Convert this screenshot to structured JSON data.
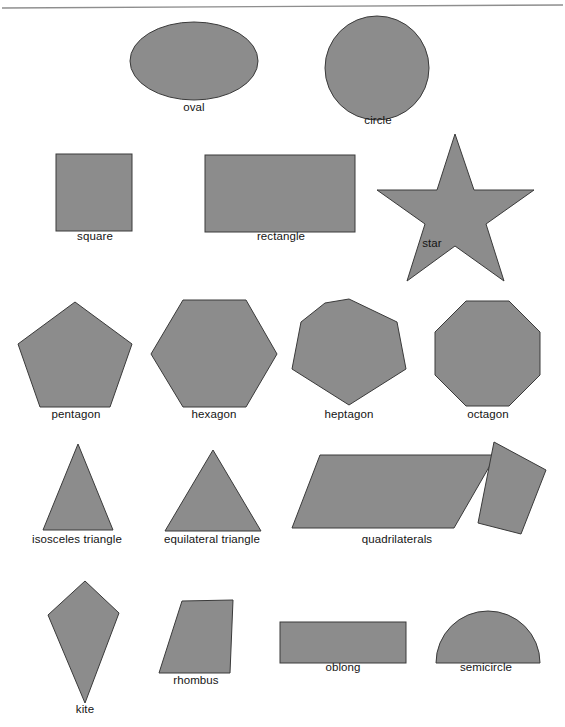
{
  "page": {
    "background_color": "#ffffff",
    "width": 565,
    "height": 727
  },
  "style": {
    "shape_fill": "#8c8c8c",
    "shape_stroke": "#3a3a3a",
    "label_color": "#141414",
    "rule_color": "#8e8e8e"
  },
  "divider": {
    "name": "top-rule",
    "x1": 2,
    "y1": 8,
    "x2": 563,
    "y2": 5
  },
  "rows": [
    {
      "row_name": "curved-and-round-shapes",
      "shapes": [
        {
          "key": "oval",
          "label": "oval",
          "type": "ellipse",
          "label_x": 194,
          "label_y": 107
        },
        {
          "key": "circle",
          "label": "circle",
          "type": "circle",
          "label_x": 378,
          "label_y": 120
        }
      ]
    },
    {
      "row_name": "quadrilaterals-and-star",
      "shapes": [
        {
          "key": "square",
          "label": "square",
          "type": "square",
          "label_x": 95,
          "label_y": 236
        },
        {
          "key": "rectangle",
          "label": "rectangle",
          "type": "rect",
          "label_x": 281,
          "label_y": 236
        },
        {
          "key": "star",
          "label": "star",
          "type": "star5",
          "label_x": 432,
          "label_y": 243
        }
      ]
    },
    {
      "row_name": "regular-polygons",
      "shapes": [
        {
          "key": "pentagon",
          "label": "pentagon",
          "type": "polygon5",
          "label_x": 76,
          "label_y": 414
        },
        {
          "key": "hexagon",
          "label": "hexagon",
          "type": "polygon6",
          "label_x": 214,
          "label_y": 414
        },
        {
          "key": "heptagon",
          "label": "heptagon",
          "type": "polygon7",
          "label_x": 349,
          "label_y": 414
        },
        {
          "key": "octagon",
          "label": "octagon",
          "type": "polygon8",
          "label_x": 488,
          "label_y": 414
        }
      ]
    },
    {
      "row_name": "triangles-and-quadrilaterals",
      "shapes": [
        {
          "key": "isosceles-triangle",
          "label": "isosceles triangle",
          "type": "triangle-isosceles",
          "label_x": 77,
          "label_y": 539
        },
        {
          "key": "equilateral-triangle",
          "label": "equilateral triangle",
          "type": "triangle-equilateral",
          "label_x": 212,
          "label_y": 539
        },
        {
          "key": "quadrilaterals",
          "label": "quadrilaterals",
          "type": "quad-group",
          "label_x": 397,
          "label_y": 539
        }
      ]
    },
    {
      "row_name": "kite-rhombus-oblong-semicircle",
      "shapes": [
        {
          "key": "kite",
          "label": "kite",
          "type": "kite",
          "label_x": 85,
          "label_y": 709
        },
        {
          "key": "rhombus",
          "label": "rhombus",
          "type": "rhombus",
          "label_x": 196,
          "label_y": 680
        },
        {
          "key": "oblong",
          "label": "oblong",
          "type": "oblong",
          "label_x": 343,
          "label_y": 667
        },
        {
          "key": "semicircle",
          "label": "semicircle",
          "type": "semicircle",
          "label_x": 486,
          "label_y": 667
        }
      ]
    }
  ],
  "geometry": {
    "oval": {
      "cx": 194,
      "cy": 61,
      "rx": 64,
      "ry": 39
    },
    "circle": {
      "cx": 377,
      "cy": 68,
      "r": 52
    },
    "square": {
      "x": 56,
      "y": 154,
      "w": 76,
      "h": 77
    },
    "rectangle": {
      "x": 205,
      "y": 155,
      "w": 150,
      "h": 77
    },
    "star": {
      "points": "455,134 474,190 534,190 486,224 504,281 455,246 407,281 425,224 377,190 437,190"
    },
    "pentagon": {
      "points": "75,302 132,344 110,407 40,407 18,344"
    },
    "hexagon": {
      "points": "183,300 246,300 277,354 246,407 183,407 151,354"
    },
    "heptagon": {
      "points": "349,299 392,320 402,366 349,402 297,366 307,320"
    },
    "heptagon7": {
      "points": "349,299 397,322 406,369 349,405 292,369 301,322 325,303"
    },
    "octagon": {
      "points": "466,301 509,301 540,332 540,375 509,406 466,406 435,375 435,332"
    },
    "tri_isosceles": {
      "points": "78,444 113,530 43,530"
    },
    "tri_equilateral": {
      "points": "213,450 261,531 165,531"
    },
    "quad_parallelogram": {
      "points": "320,455 496,455 454,528 292,528"
    },
    "quad_irregular": {
      "points": "494,442 546,470 521,534 478,523"
    },
    "kite": {
      "points": "85,581 119,613 85,703 48,615"
    },
    "rhombus": {
      "points": "182,601 233,600 230,673 159,673"
    },
    "oblong": {
      "x": 280,
      "y": 622,
      "w": 126,
      "h": 41
    },
    "semicircle": {
      "cx": 488,
      "cy": 663,
      "r": 52
    }
  }
}
